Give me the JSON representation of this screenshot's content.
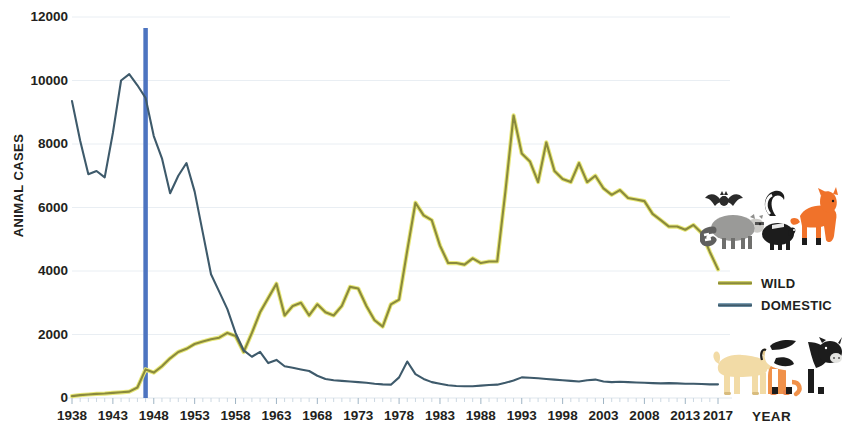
{
  "chart_data": {
    "type": "line",
    "title": "",
    "xlabel": "YEAR",
    "ylabel": "ANIMAL CASES",
    "xlim": [
      1938,
      2017
    ],
    "ylim": [
      0,
      12000
    ],
    "ytick_values": [
      0,
      2000,
      4000,
      6000,
      8000,
      10000,
      12000
    ],
    "ytick_labels": [
      "0",
      "2000",
      "4000",
      "6000",
      "8000",
      "10000",
      "12000"
    ],
    "xtick_labels": [
      "1938",
      "1943",
      "1948",
      "1953",
      "1958",
      "1963",
      "1968",
      "1973",
      "1978",
      "1983",
      "1988",
      "1993",
      "1998",
      "2003",
      "2008",
      "2013",
      "2017"
    ],
    "xtick_values": [
      1938,
      1943,
      1948,
      1953,
      1958,
      1963,
      1968,
      1973,
      1978,
      1983,
      1988,
      1993,
      1998,
      2003,
      2008,
      2013,
      2017
    ],
    "grid": true,
    "grid_axis": "y",
    "legend_position": "right",
    "x": [
      1938,
      1939,
      1940,
      1941,
      1942,
      1943,
      1944,
      1945,
      1946,
      1947,
      1948,
      1949,
      1950,
      1951,
      1952,
      1953,
      1954,
      1955,
      1956,
      1957,
      1958,
      1959,
      1960,
      1961,
      1962,
      1963,
      1964,
      1965,
      1966,
      1967,
      1968,
      1969,
      1970,
      1971,
      1972,
      1973,
      1974,
      1975,
      1976,
      1977,
      1978,
      1979,
      1980,
      1981,
      1982,
      1983,
      1984,
      1985,
      1986,
      1987,
      1988,
      1989,
      1990,
      1991,
      1992,
      1993,
      1994,
      1995,
      1996,
      1997,
      1998,
      1999,
      2000,
      2001,
      2002,
      2003,
      2004,
      2005,
      2006,
      2007,
      2008,
      2009,
      2010,
      2011,
      2012,
      2013,
      2014,
      2015,
      2016,
      2017
    ],
    "series": [
      {
        "name": "WILD",
        "color": "#8a8a3c",
        "edge_color": "#e8e87a",
        "values": [
          60,
          90,
          110,
          130,
          140,
          160,
          180,
          200,
          330,
          900,
          800,
          1000,
          1250,
          1450,
          1550,
          1700,
          1780,
          1850,
          1900,
          2050,
          1950,
          1450,
          2050,
          2700,
          3150,
          3600,
          2600,
          2900,
          3000,
          2600,
          2950,
          2700,
          2600,
          2900,
          3500,
          3450,
          2900,
          2450,
          2250,
          2950,
          3100,
          4650,
          6150,
          5750,
          5600,
          4800,
          4250,
          4250,
          4200,
          4400,
          4250,
          4300,
          4300,
          6500,
          8900,
          7700,
          7450,
          6800,
          8050,
          7150,
          6900,
          6800,
          7400,
          6800,
          7000,
          6600,
          6400,
          6550,
          6300,
          6250,
          6200,
          5800,
          5600,
          5400,
          5400,
          5300,
          5450,
          5200,
          4600,
          4050
        ]
      },
      {
        "name": "DOMESTIC",
        "color": "#3e5a6b",
        "edge_color": "#3e5a6b",
        "values": [
          9350,
          8100,
          7050,
          7150,
          6950,
          8350,
          10000,
          10200,
          9850,
          9450,
          8250,
          7550,
          6450,
          7000,
          7400,
          6500,
          5200,
          3900,
          3350,
          2800,
          2050,
          1500,
          1300,
          1450,
          1100,
          1200,
          1000,
          950,
          900,
          850,
          700,
          600,
          560,
          540,
          520,
          500,
          480,
          450,
          430,
          420,
          650,
          1150,
          750,
          600,
          500,
          450,
          400,
          380,
          370,
          370,
          390,
          410,
          420,
          480,
          550,
          650,
          640,
          620,
          600,
          580,
          560,
          540,
          520,
          560,
          580,
          520,
          500,
          510,
          500,
          490,
          480,
          470,
          460,
          470,
          460,
          450,
          450,
          440,
          430,
          430
        ]
      }
    ],
    "annotations": [
      {
        "type": "vline",
        "label": "",
        "x": 1947,
        "color": "#4d74c0",
        "y_top": 11650,
        "y_bottom": 0
      }
    ],
    "images": [
      {
        "name": "wild-animals-illustration",
        "animals": [
          "bat",
          "raccoon",
          "skunk",
          "fox"
        ]
      },
      {
        "name": "domestic-animals-illustration",
        "animals": [
          "dog",
          "cat",
          "cow"
        ]
      }
    ]
  },
  "legend": {
    "items": [
      {
        "label": "WILD",
        "color": "#8a8a3c"
      },
      {
        "label": "DOMESTIC",
        "color": "#3e5a6b"
      }
    ]
  },
  "axes": {
    "y_title": "ANIMAL CASES",
    "x_title": "YEAR"
  }
}
